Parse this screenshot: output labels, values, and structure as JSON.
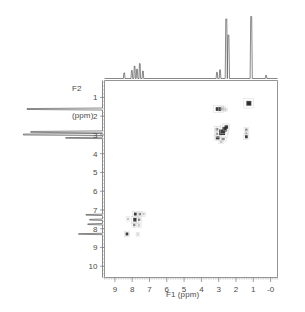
{
  "figure": {
    "kind": "2d-nmr-spectrum",
    "background_color": "#ffffff",
    "ink_color": "#2b2b2b",
    "axis_color": "#7a7a7a"
  },
  "axes": {
    "x": {
      "label": "F1 (ppm)",
      "ticks": [
        "9",
        "8",
        "7",
        "6",
        "5",
        "4",
        "3",
        "2",
        "1",
        "-0"
      ],
      "values": [
        9,
        8,
        7,
        6,
        5,
        4,
        3,
        2,
        1,
        0
      ],
      "min": -0.4,
      "max": 9.6,
      "reversed": true
    },
    "y": {
      "label": "F2\n(ppm)",
      "label_line1": "F2",
      "label_line2": "(ppm)",
      "ticks": [
        "1",
        "2",
        "3",
        "4",
        "5",
        "6",
        "7",
        "8",
        "9",
        "10"
      ],
      "values": [
        1,
        2,
        3,
        4,
        5,
        6,
        7,
        8,
        9,
        10
      ],
      "min": 0.1,
      "max": 10.6,
      "reversed": false
    }
  },
  "chart_data": {
    "type": "scatter",
    "title": "",
    "xlabel": "F1 (ppm)",
    "ylabel": "F2 (ppm)",
    "xlim": [
      9.6,
      -0.4
    ],
    "ylim": [
      10.6,
      0.1
    ],
    "grid": false,
    "legend": "none",
    "cross_peaks": [
      {
        "f1": 3.02,
        "f2": 1.62,
        "w": 0.3,
        "h": 0.2,
        "intensity": "strong"
      },
      {
        "f1": 2.86,
        "f2": 1.62,
        "w": 0.16,
        "h": 0.16,
        "intensity": "medium"
      },
      {
        "f1": 2.72,
        "f2": 1.6,
        "w": 0.12,
        "h": 0.12,
        "intensity": "faint"
      },
      {
        "f1": 2.6,
        "f2": 1.66,
        "w": 0.1,
        "h": 0.1,
        "intensity": "faint"
      },
      {
        "f1": 1.26,
        "f2": 1.32,
        "w": 0.3,
        "h": 0.26,
        "intensity": "strong"
      },
      {
        "f1": 1.26,
        "f2": 1.32,
        "w": 0.16,
        "h": 0.14,
        "intensity": "strong"
      },
      {
        "f1": 3.1,
        "f2": 2.7,
        "w": 0.16,
        "h": 0.14,
        "intensity": "medium"
      },
      {
        "f1": 3.1,
        "f2": 2.94,
        "w": 0.14,
        "h": 0.12,
        "intensity": "medium"
      },
      {
        "f1": 3.06,
        "f2": 3.16,
        "w": 0.22,
        "h": 0.16,
        "intensity": "strong"
      },
      {
        "f1": 2.8,
        "f2": 2.86,
        "w": 0.34,
        "h": 0.3,
        "intensity": "strong"
      },
      {
        "f1": 2.66,
        "f2": 2.7,
        "w": 0.26,
        "h": 0.24,
        "intensity": "strong"
      },
      {
        "f1": 2.56,
        "f2": 2.58,
        "w": 0.2,
        "h": 0.18,
        "intensity": "strong"
      },
      {
        "f1": 2.74,
        "f2": 3.22,
        "w": 0.18,
        "h": 0.12,
        "intensity": "medium"
      },
      {
        "f1": 2.86,
        "f2": 3.38,
        "w": 0.14,
        "h": 0.1,
        "intensity": "faint"
      },
      {
        "f1": 1.4,
        "f2": 2.72,
        "w": 0.14,
        "h": 0.12,
        "intensity": "medium"
      },
      {
        "f1": 1.4,
        "f2": 2.92,
        "w": 0.12,
        "h": 0.1,
        "intensity": "medium"
      },
      {
        "f1": 1.4,
        "f2": 3.1,
        "w": 0.16,
        "h": 0.16,
        "intensity": "strong"
      },
      {
        "f1": 7.82,
        "f2": 7.22,
        "w": 0.16,
        "h": 0.16,
        "intensity": "strong"
      },
      {
        "f1": 7.56,
        "f2": 7.22,
        "w": 0.14,
        "h": 0.14,
        "intensity": "medium"
      },
      {
        "f1": 7.34,
        "f2": 7.22,
        "w": 0.12,
        "h": 0.12,
        "intensity": "faint"
      },
      {
        "f1": 7.84,
        "f2": 7.52,
        "w": 0.2,
        "h": 0.2,
        "intensity": "strong"
      },
      {
        "f1": 7.6,
        "f2": 7.52,
        "w": 0.14,
        "h": 0.14,
        "intensity": "medium"
      },
      {
        "f1": 8.24,
        "f2": 7.48,
        "w": 0.12,
        "h": 0.12,
        "intensity": "faint"
      },
      {
        "f1": 7.88,
        "f2": 7.8,
        "w": 0.14,
        "h": 0.14,
        "intensity": "medium"
      },
      {
        "f1": 7.6,
        "f2": 7.82,
        "w": 0.12,
        "h": 0.12,
        "intensity": "faint"
      },
      {
        "f1": 8.3,
        "f2": 8.28,
        "w": 0.16,
        "h": 0.16,
        "intensity": "strong"
      },
      {
        "f1": 7.68,
        "f2": 8.3,
        "w": 0.1,
        "h": 0.1,
        "intensity": "faint"
      }
    ],
    "f1_projection": {
      "axis": "F1",
      "description": "1D proton trace plotted above the contour map",
      "peaks": [
        {
          "ppm": 8.46,
          "height": 0.09
        },
        {
          "ppm": 8.02,
          "height": 0.13
        },
        {
          "ppm": 7.86,
          "height": 0.2
        },
        {
          "ppm": 7.72,
          "height": 0.15
        },
        {
          "ppm": 7.56,
          "height": 0.24
        },
        {
          "ppm": 7.38,
          "height": 0.12
        },
        {
          "ppm": 3.1,
          "height": 0.1
        },
        {
          "ppm": 2.92,
          "height": 0.14
        },
        {
          "ppm": 2.56,
          "height": 0.96
        },
        {
          "ppm": 2.44,
          "height": 0.7
        },
        {
          "ppm": 1.12,
          "height": 1.0
        },
        {
          "ppm": 0.26,
          "height": 0.05
        }
      ]
    },
    "f2_projection": {
      "axis": "F2",
      "description": "1D proton trace plotted to the left of the contour map",
      "peaks": [
        {
          "ppm": 1.62,
          "height": 0.82
        },
        {
          "ppm": 2.84,
          "height": 0.78
        },
        {
          "ppm": 2.98,
          "height": 0.86
        },
        {
          "ppm": 3.16,
          "height": 0.4
        },
        {
          "ppm": 7.26,
          "height": 0.18
        },
        {
          "ppm": 7.52,
          "height": 0.14
        },
        {
          "ppm": 7.76,
          "height": 0.16
        },
        {
          "ppm": 8.28,
          "height": 0.26
        }
      ]
    }
  }
}
